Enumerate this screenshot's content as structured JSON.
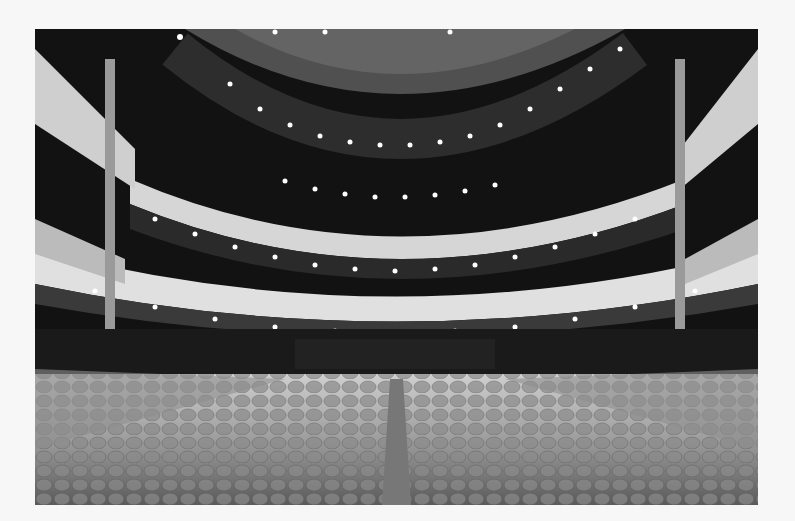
{
  "image": {
    "subject": "Theater auditorium interior viewed from the stalls toward the balconies",
    "palette": {
      "background": "#f7f7f7",
      "dark": "#111111",
      "balcony": "#d8d8d8",
      "seat": "#9a9a9a"
    },
    "elements": [
      "ceiling with downlights",
      "two curved balcony tiers",
      "side boxes",
      "columns",
      "orchestra seating",
      "center aisle"
    ]
  }
}
